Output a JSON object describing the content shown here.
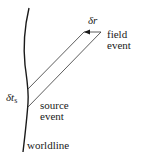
{
  "diagram": {
    "type": "spacetime-diagram",
    "labels": {
      "delta_r": "δr",
      "field_event": [
        "field",
        "event"
      ],
      "delta_t_s_main": "δt",
      "delta_t_s_sub": "s",
      "source_event": [
        "source",
        "event"
      ],
      "worldline": "worldline"
    },
    "elements": [
      {
        "name": "worldline",
        "kind": "curve"
      },
      {
        "name": "null-strip-upper",
        "kind": "line",
        "from": "worldline",
        "to": "field-event"
      },
      {
        "name": "null-strip-lower",
        "kind": "line",
        "from": "source-event",
        "to": "field-event"
      },
      {
        "name": "delta-r-arrow",
        "kind": "arrow",
        "direction": "left"
      }
    ],
    "colors": {
      "stroke": "#1a1a1a",
      "background": "#ffffff"
    }
  }
}
